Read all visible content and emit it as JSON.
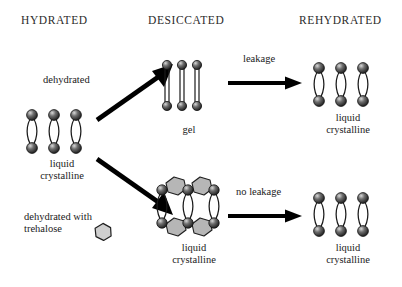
{
  "figure": {
    "title_row": {
      "hydrated": "HYDRATED",
      "desiccated": "DESICCATED",
      "rehydrated": "REHYDRATED"
    },
    "colors": {
      "ink": "#1a1a1a",
      "header_ink": "#2b2b2b",
      "background": "#ffffff",
      "head_group_dark": "#242424",
      "head_group_mid": "#6f6f6f",
      "head_group_light": "#d8d8d8",
      "trehalose_fill": "#b6b6b6",
      "trehalose_fill_light": "#cfcfcf",
      "trehalose_stroke": "#1f1f1f",
      "tail_stroke": "#1a1a1a",
      "arrow": "#000000"
    },
    "structures": {
      "hydrated_liquid_crystalline": {
        "id": "liquid-crystalline-hydrated",
        "caption_line1": "liquid",
        "caption_line2": "crystalline",
        "lipid_pairs": 3,
        "tail_style": "curved",
        "trehalose": false
      },
      "gel": {
        "id": "gel",
        "caption_line1": "gel",
        "caption_line2": "",
        "lipid_pairs": 3,
        "tail_style": "straight",
        "trehalose": false
      },
      "desiccated_trehalose_liquid_crystalline": {
        "id": "liquid-crystalline-trehalose",
        "caption_line1": "liquid",
        "caption_line2": "crystalline",
        "lipid_pairs": 3,
        "tail_style": "curved",
        "trehalose": true,
        "trehalose_top_count": 2,
        "trehalose_bottom_count": 2
      },
      "rehydrated_top_liquid_crystalline": {
        "id": "liquid-crystalline-rehydrated-top",
        "caption_line1": "liquid",
        "caption_line2": "crystalline",
        "lipid_pairs": 3,
        "tail_style": "curved",
        "trehalose": false
      },
      "rehydrated_bottom_liquid_crystalline": {
        "id": "liquid-crystalline-rehydrated-bottom",
        "caption_line1": "liquid",
        "caption_line2": "crystalline",
        "lipid_pairs": 3,
        "tail_style": "curved",
        "trehalose": false
      }
    },
    "arrows": {
      "dehydrated": {
        "label": "dehydrated",
        "direction": "up-right"
      },
      "dehydrated_with_trehalose": {
        "label_line1": "dehydrated with",
        "label_line2": "trehalose",
        "direction": "down-right",
        "legend_symbol": "trehalose-hexagon"
      },
      "leakage": {
        "label": "leakage",
        "direction": "right"
      },
      "no_leakage": {
        "label": "no leakage",
        "direction": "right"
      }
    }
  }
}
